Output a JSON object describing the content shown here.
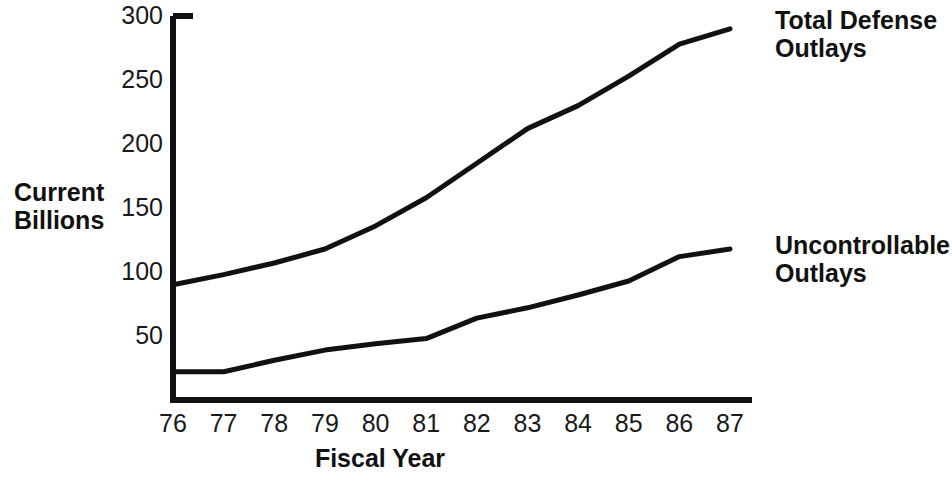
{
  "chart_data": {
    "type": "line",
    "title": "",
    "subtitle": "",
    "xlabel": "Fiscal Year",
    "ylabel": "Current Billions",
    "categories": [
      "76",
      "77",
      "78",
      "79",
      "80",
      "81",
      "82",
      "83",
      "84",
      "85",
      "86",
      "87"
    ],
    "x": [
      76,
      77,
      78,
      79,
      80,
      81,
      82,
      83,
      84,
      85,
      86,
      87
    ],
    "ylim": [
      0,
      300
    ],
    "xlim": [
      76,
      87
    ],
    "ytick_labels": [
      "50",
      "100",
      "150",
      "200",
      "250",
      "300"
    ],
    "ytick_values": [
      50,
      100,
      150,
      200,
      250,
      300
    ],
    "xtick_labels": [
      "76",
      "77",
      "78",
      "79",
      "80",
      "81",
      "82",
      "83",
      "84",
      "85",
      "86",
      "87"
    ],
    "grid": false,
    "legend_position": "right-inline",
    "line_color": "#111111",
    "series": [
      {
        "name": "Total Defense Outlays",
        "values": [
          90,
          98,
          107,
          118,
          136,
          158,
          185,
          212,
          230,
          253,
          278,
          290
        ]
      },
      {
        "name": "Uncontrollable Outlays",
        "values": [
          22,
          22,
          31,
          39,
          44,
          48,
          64,
          72,
          82,
          93,
          112,
          118
        ]
      }
    ]
  },
  "axes": {
    "y_title_line1": "Current",
    "y_title_line2": "Billions",
    "x_title": "Fiscal Year"
  },
  "legend": {
    "total_line1": "Total Defense",
    "total_line2": "Outlays",
    "uncontrollable_line1": "Uncontrollable",
    "uncontrollable_line2": "Outlays"
  }
}
